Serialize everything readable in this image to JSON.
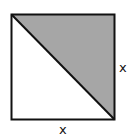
{
  "diagram": {
    "shape": "square",
    "square": {
      "x": 11.5,
      "y": 14.5,
      "width": 103,
      "height": 105
    },
    "diagonal": {
      "from": "top-left",
      "to": "bottom-right"
    },
    "shaded_region": "upper-right triangle",
    "colors": {
      "shade": "#a6a6a6",
      "stroke": "#111111",
      "background": "#ffffff"
    },
    "labels": {
      "right_side": "x",
      "bottom_side": "x"
    }
  }
}
